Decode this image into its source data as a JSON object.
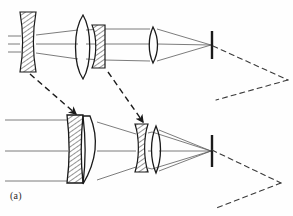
{
  "figure": {
    "caption": "(a)",
    "background_color": "#fefefe",
    "ink_color": "#1a1a1a",
    "ray_color": "#555555",
    "hatch_color": "#333333"
  },
  "systems": [
    {
      "id": "upper",
      "name": "short-focal-length-configuration",
      "label": "upper optical train",
      "entering_ray_heights": [
        36,
        44,
        52
      ],
      "entering_ray_start_x": 8,
      "image_plane_x": 212,
      "image_plane_y_top": 31,
      "image_plane_y_bottom": 59,
      "focus_y": 45,
      "elements": [
        {
          "id": "u1",
          "name": "negative-meniscus-front-group",
          "type": "negative",
          "hatched": true,
          "x": 20,
          "width": 16,
          "y_top": 12,
          "y_bottom": 72
        },
        {
          "id": "u2",
          "name": "positive-biconvex-lens",
          "type": "positive",
          "hatched": false,
          "x": 76,
          "width": 14,
          "y_top": 15,
          "y_bottom": 79
        },
        {
          "id": "u3",
          "name": "negative-hatched-element",
          "type": "negative",
          "hatched": true,
          "x": 92,
          "width": 13,
          "y_top": 25,
          "y_bottom": 68
        },
        {
          "id": "u4",
          "name": "positive-rear-lens",
          "type": "positive",
          "hatched": false,
          "x": 148,
          "width": 11,
          "y_top": 27,
          "y_bottom": 63
        }
      ]
    },
    {
      "id": "lower",
      "name": "long-focal-length-configuration",
      "label": "lower optical train",
      "entering_ray_heights": [
        120,
        151,
        181
      ],
      "entering_ray_start_x": 5,
      "image_plane_x": 212,
      "image_plane_y_top": 135,
      "image_plane_y_bottom": 167,
      "focus_y": 151,
      "elements": [
        {
          "id": "l1",
          "name": "negative-meniscus-front-group",
          "type": "negative",
          "hatched": true,
          "x": 67,
          "width": 16,
          "y_top": 115,
          "y_bottom": 183
        },
        {
          "id": "l2",
          "name": "positive-meniscus-lens",
          "type": "positive",
          "hatched": false,
          "x": 83,
          "width": 15,
          "y_top": 116,
          "y_bottom": 184
        },
        {
          "id": "l3",
          "name": "negative-biconcave-element",
          "type": "negative",
          "hatched": true,
          "x": 135,
          "width": 13,
          "y_top": 124,
          "y_bottom": 172
        },
        {
          "id": "l4",
          "name": "positive-rear-lens",
          "type": "positive",
          "hatched": false,
          "x": 151,
          "width": 10,
          "y_top": 126,
          "y_bottom": 173
        }
      ]
    }
  ],
  "motion_arrows": [
    {
      "id": "a1",
      "name": "front-group-motion-arrow",
      "from_x": 30,
      "from_y": 74,
      "to_x": 76,
      "to_y": 114,
      "style": "dashed-with-arrowhead"
    },
    {
      "id": "a2",
      "name": "middle-group-motion-arrow",
      "from_x": 108,
      "from_y": 72,
      "to_x": 143,
      "to_y": 122,
      "style": "dashed-with-arrowhead"
    }
  ],
  "field_chevrons": [
    {
      "id": "c1",
      "name": "upper-field-angle-chevron",
      "apex_x": 288,
      "apex_y": 80,
      "arm1_x": 213,
      "arm1_y": 46,
      "arm2_x": 216,
      "arm2_y": 100,
      "style": "dashed"
    },
    {
      "id": "c2",
      "name": "lower-field-angle-chevron",
      "apex_x": 281,
      "apex_y": 183,
      "arm1_x": 212,
      "arm1_y": 150,
      "arm2_x": 214,
      "arm2_y": 209,
      "style": "dashed"
    }
  ]
}
